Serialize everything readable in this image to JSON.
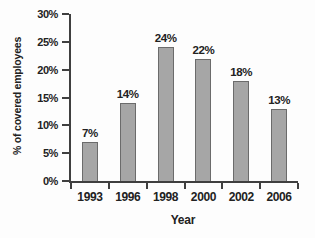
{
  "chart_data": {
    "type": "bar",
    "title": "",
    "xlabel": "Year",
    "ylabel": "% of covered employees",
    "categories": [
      "1993",
      "1996",
      "1998",
      "2000",
      "2002",
      "2006"
    ],
    "values": [
      7,
      14,
      24,
      22,
      18,
      13
    ],
    "value_labels": [
      "7%",
      "14%",
      "24%",
      "22%",
      "18%",
      "13%"
    ],
    "ylim": [
      0,
      30
    ],
    "yticks": [
      0,
      5,
      10,
      15,
      20,
      25,
      30
    ],
    "ytick_suffix": "%",
    "grid": false,
    "legend": "none",
    "colors": {
      "bar_fill": "#a6a6a6",
      "bar_border": "#6b6b6b",
      "axis": "#3f3f3f",
      "text": "#222222",
      "background": "#fdfdfd"
    }
  }
}
